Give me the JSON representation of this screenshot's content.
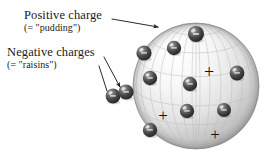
{
  "figure": {
    "kind": "plum-pudding-atom-diagram",
    "background_color": "#ffffff"
  },
  "labels": {
    "positive": {
      "title": "Positive charge",
      "subtitle": "(= \"pudding\")"
    },
    "negative": {
      "title": "Negative charges",
      "subtitle": "(= \"raisins\")"
    }
  },
  "sphere": {
    "center_x": 196,
    "center_y": 86,
    "radius": 63,
    "fill_light": "#fdfdfd",
    "fill_mid": "#e6e6e6",
    "fill_shadow": "#9a9a9a",
    "mesh_color": "#b8b8b8",
    "outline_color": "#8d8d8d"
  },
  "electrons": {
    "symbol": "−",
    "body_color": "#3a3a3a",
    "highlight_color": "#d8d8d8",
    "items": [
      {
        "cx": 113,
        "cy": 96,
        "r": 7.4,
        "outside": true
      },
      {
        "cx": 144,
        "cy": 53,
        "r": 7.6,
        "outside": false
      },
      {
        "cx": 196,
        "cy": 34,
        "r": 8.0,
        "outside": false
      },
      {
        "cx": 174,
        "cy": 48,
        "r": 7.2,
        "outside": false
      },
      {
        "cx": 150,
        "cy": 78,
        "r": 7.2,
        "outside": false
      },
      {
        "cx": 190,
        "cy": 84,
        "r": 7.2,
        "outside": false
      },
      {
        "cx": 237,
        "cy": 73,
        "r": 7.4,
        "outside": false
      },
      {
        "cx": 187,
        "cy": 111,
        "r": 7.2,
        "outside": false
      },
      {
        "cx": 224,
        "cy": 110,
        "r": 7.0,
        "outside": false
      },
      {
        "cx": 150,
        "cy": 130,
        "r": 7.2,
        "outside": false
      },
      {
        "cx": 126,
        "cy": 92,
        "r": 7.6,
        "outside": true
      }
    ]
  },
  "positive_marks": {
    "symbol": "+",
    "color": "#111111",
    "items": [
      {
        "cx": 209,
        "cy": 72,
        "size": 18
      },
      {
        "cx": 163,
        "cy": 115,
        "size": 17
      },
      {
        "cx": 215,
        "cy": 134,
        "size": 17
      }
    ]
  },
  "leader_lines": {
    "stroke_color": "#1f1f1f",
    "arrows": [
      {
        "name": "positive-arrow",
        "x1": 112,
        "y1": 19,
        "x2": 158,
        "y2": 27,
        "arrowhead": true
      },
      {
        "name": "negative-arrow-upper",
        "x1": 104,
        "y1": 57,
        "x2": 120,
        "y2": 87,
        "arrowhead": true
      },
      {
        "name": "negative-arrow-lower",
        "x1": 99,
        "y1": 66,
        "x2": 107,
        "y2": 91,
        "arrowhead": false
      }
    ]
  }
}
